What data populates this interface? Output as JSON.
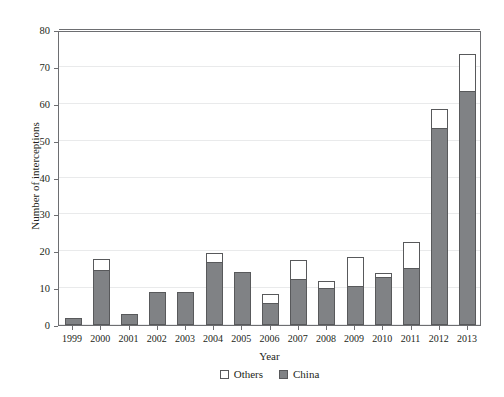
{
  "chart_data": {
    "type": "bar",
    "title": "",
    "subtitle": "",
    "xlabel": "Year",
    "ylabel": "Number of interceptions",
    "categories": [
      "1999",
      "2000",
      "2001",
      "2002",
      "2003",
      "2004",
      "2005",
      "2006",
      "2007",
      "2008",
      "2009",
      "2010",
      "2011",
      "2012",
      "2013"
    ],
    "series": [
      {
        "name": "China",
        "color": "#808285",
        "values": [
          2,
          15,
          3,
          9,
          9,
          17,
          14.5,
          6,
          12.5,
          10,
          10.5,
          13,
          15.5,
          53.5,
          63.5
        ]
      },
      {
        "name": "Others",
        "color": "#ffffff",
        "values": [
          0,
          3,
          0,
          0,
          0,
          2.5,
          0,
          2.5,
          5,
          2,
          8,
          1,
          7,
          5,
          10
        ]
      }
    ],
    "stacked": true,
    "totals": [
      2,
      18,
      3,
      9,
      9,
      19.5,
      14.5,
      8.5,
      17.5,
      12,
      18.5,
      14,
      22.5,
      58.5,
      73.5
    ],
    "ylim": [
      0,
      80
    ],
    "yticks": [
      0,
      10,
      20,
      30,
      40,
      50,
      60,
      70,
      80
    ],
    "grid": true,
    "legend_position": "bottom",
    "legend": [
      "Others",
      "China"
    ]
  },
  "axis": {
    "y_title": "Number of interceptions",
    "x_title": "Year"
  },
  "legend": {
    "others_label": "Others",
    "china_label": "China"
  },
  "colors": {
    "china_fill": "#808285",
    "others_fill": "#ffffff",
    "outline": "#58595b",
    "grid": "#e9eaeb",
    "frame": "#6d6e71",
    "text": "#231f20"
  }
}
